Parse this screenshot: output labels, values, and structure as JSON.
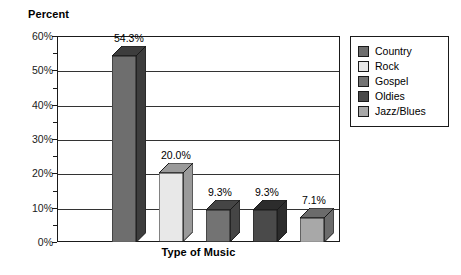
{
  "chart_data": {
    "type": "bar",
    "title": "",
    "xlabel": "Type of Music",
    "ylabel": "Percent",
    "categories": [
      "Country",
      "Rock",
      "Gospel",
      "Oldies",
      "Jazz/Blues"
    ],
    "values": [
      54.3,
      20.0,
      9.3,
      9.3,
      7.1
    ],
    "data_labels": [
      "54.3%",
      "20.0%",
      "9.3%",
      "9.3%",
      "7.1%"
    ],
    "ylim": [
      0,
      60
    ],
    "y_ticks": [
      0,
      10,
      20,
      30,
      40,
      50,
      60
    ],
    "y_tick_labels": [
      "0%",
      "10%",
      "20%",
      "30%",
      "40%",
      "50%",
      "60%"
    ],
    "y_minor_ticks": [
      5,
      15,
      25,
      35,
      45,
      55
    ],
    "grid": "horizontal",
    "legend_position": "right",
    "style": "3d-bars",
    "series_colors": [
      "#6e6e6e",
      "#e8e8e8",
      "#737373",
      "#4a4a4a",
      "#a8a8a8"
    ],
    "side_colors": [
      "#3d3d3d",
      "#9a9a9a",
      "#454545",
      "#2c2c2c",
      "#6b6b6b"
    ],
    "legend": [
      {
        "label": "Country",
        "color": "#6e6e6e"
      },
      {
        "label": "Rock",
        "color": "#e8e8e8"
      },
      {
        "label": "Gospel",
        "color": "#737373"
      },
      {
        "label": "Oldies",
        "color": "#4a4a4a"
      },
      {
        "label": "Jazz/Blues",
        "color": "#a8a8a8"
      }
    ]
  }
}
